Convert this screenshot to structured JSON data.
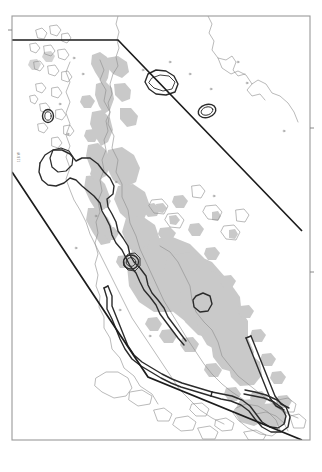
{
  "figure": {
    "type": "map",
    "title": "",
    "region_name": "Baja California Peninsula and Gulf of California",
    "projection_note": "",
    "frame": {
      "x": 12,
      "y": 16,
      "width": 298,
      "height": 424,
      "stroke_color": "#9a9a9a",
      "fill_color": "#ffffff"
    },
    "axis_labels": {
      "left_vertical_label": "118 W"
    },
    "colors": {
      "background": "#ffffff",
      "frame_stroke": "#9a9a9a",
      "coastline_stroke": "#8c8c8c",
      "elevation_fill": "#c9c9c9",
      "study_boundary_stroke": "#1c1c1c",
      "contour_stroke": "#2b2b2b",
      "contour_fill": "#ffffff"
    },
    "legend": {
      "present": false,
      "entries": []
    },
    "scalebar": {
      "present": false
    },
    "layers": [
      {
        "name": "coastline",
        "label": "Coastline",
        "stroke": "#8c8c8c",
        "width": 0.55
      },
      {
        "name": "elevation-shading",
        "label": "Shaded terrain / elevation",
        "fill": "#c9c9c9"
      },
      {
        "name": "study-area-boundary",
        "label": "Study area boundary",
        "stroke": "#1c1c1c",
        "width": 1.6
      },
      {
        "name": "range-contour",
        "label": "Range contour outline",
        "stroke": "#2b2b2b",
        "width": 1.5
      }
    ],
    "study_area_polygon": {
      "label": "Study area boundary polygon",
      "vertices": [
        [
          12,
          40
        ],
        [
          118,
          40
        ],
        [
          302,
          231
        ],
        [
          302,
          440
        ],
        [
          148,
          377
        ],
        [
          12,
          172
        ]
      ],
      "note": "Open polyline: top horizontal segment, NE diagonal, lower diagonal returning to left frame edge"
    }
  }
}
